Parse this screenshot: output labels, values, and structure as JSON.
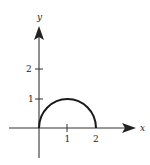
{
  "diagram": {
    "title": "",
    "x_axis": {
      "label": "x",
      "ticks": [
        "1",
        "2"
      ]
    },
    "y_axis": {
      "label": "y",
      "ticks": [
        "1",
        "2"
      ]
    },
    "curve": {
      "type": "semicircle",
      "center": [
        1,
        0
      ],
      "radius": 1,
      "description": "upper half of circle from (0,0) to (2,0), peak at (1,1)"
    },
    "colors": {
      "stroke": "#222222",
      "background": "#ffffff"
    }
  }
}
